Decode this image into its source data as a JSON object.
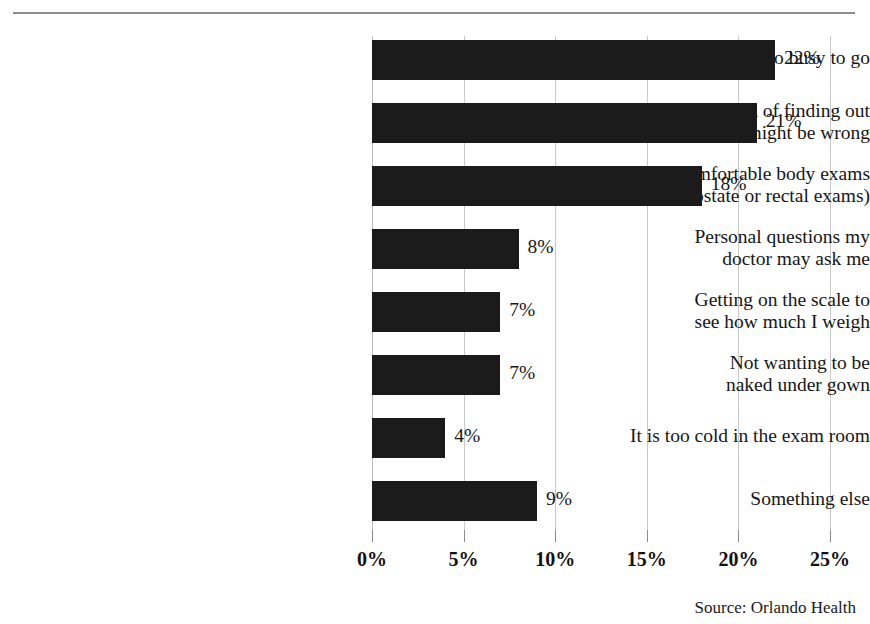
{
  "chart_data": {
    "type": "bar",
    "orientation": "horizontal",
    "title": "",
    "subtitle": "",
    "xlabel": "",
    "ylabel": "",
    "xlim": [
      0,
      25
    ],
    "grid": true,
    "legend": null,
    "categories": [
      "Too busy to go",
      "Afraid of finding out\nwhat might be wrong",
      "Getting uncomfortable body exams\n(e.g., prostate or rectal exams)",
      "Personal questions my\ndoctor may ask me",
      "Getting on the scale to\nsee how much I weigh",
      "Not wanting to be\nnaked under gown",
      "It is too cold in the exam room",
      "Something else"
    ],
    "values": [
      22,
      21,
      18,
      8,
      7,
      7,
      4,
      9
    ],
    "value_labels": [
      "22%",
      "21%",
      "18%",
      "8%",
      "7%",
      "7%",
      "4%",
      "9%"
    ],
    "xticks": [
      0,
      5,
      10,
      15,
      20,
      25
    ],
    "xtick_labels": [
      "0%",
      "5%",
      "10%",
      "15%",
      "20%",
      "25%"
    ],
    "bar_color": "#1b1b1b",
    "gridline_color": "#c9c9c9",
    "rule_color": "#8e8e8e",
    "text_color": "#161616"
  },
  "source": {
    "text": "Source:  Orlando Health"
  }
}
